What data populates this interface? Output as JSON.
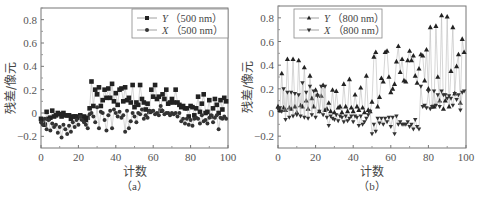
{
  "figure": {
    "panels": [
      {
        "id": "a",
        "sub_label": "（a）",
        "ylabel": "残差/像元",
        "xlabel": "计数",
        "legend": [
          {
            "series": "Y",
            "label_var": "Y",
            "label_rest": "（500 nm）",
            "marker": "square"
          },
          {
            "series": "X",
            "label_var": "X",
            "label_rest": "（500 nm）",
            "marker": "circle"
          }
        ]
      },
      {
        "id": "b",
        "sub_label": "（b）",
        "ylabel": "残差/像元",
        "xlabel": "计数",
        "legend": [
          {
            "series": "Y",
            "label_var": "Y",
            "label_rest": "（800 nm）",
            "marker": "triangle-up"
          },
          {
            "series": "X",
            "label_var": "X",
            "label_rest": "（800 nm）",
            "marker": "triangle-down"
          }
        ]
      }
    ]
  },
  "chart_data": [
    {
      "type": "scatter",
      "title": "(a)",
      "xlabel": "计数",
      "ylabel": "残差/像元",
      "xlim": [
        0,
        100
      ],
      "ylim": [
        -0.3,
        0.9
      ],
      "xticks": [
        0,
        20,
        40,
        60,
        80,
        100
      ],
      "yticks": [
        -0.2,
        0,
        0.2,
        0.4,
        0.6,
        0.8
      ],
      "ytick_labels": [
        "-0.2",
        "0",
        "0.2",
        "0.4",
        "0.6",
        "0.8"
      ],
      "grid": false,
      "legend_position": "upper right",
      "series": [
        {
          "name": "Y（500 nm）",
          "marker": "square",
          "x": [
            0,
            1,
            2,
            3,
            4,
            5,
            6,
            7,
            8,
            9,
            10,
            11,
            12,
            13,
            14,
            15,
            16,
            17,
            18,
            19,
            20,
            21,
            22,
            23,
            24,
            25,
            26,
            27,
            28,
            29,
            30,
            31,
            32,
            33,
            34,
            35,
            36,
            37,
            38,
            39,
            40,
            41,
            42,
            43,
            44,
            45,
            46,
            47,
            48,
            49,
            50,
            51,
            52,
            53,
            54,
            55,
            56,
            57,
            58,
            59,
            60,
            61,
            62,
            63,
            64,
            65,
            66,
            67,
            68,
            69,
            70,
            71,
            72,
            73,
            74,
            75,
            76,
            77,
            78,
            79,
            80,
            81,
            82,
            83,
            84,
            85,
            86,
            87,
            88,
            89,
            90,
            91,
            92,
            93,
            94,
            95,
            96,
            97,
            98,
            99
          ],
          "values": [
            -0.05,
            -0.08,
            -0.1,
            0.01,
            -0.05,
            -0.04,
            0.02,
            -0.03,
            -0.02,
            0.0,
            -0.01,
            -0.03,
            0.0,
            -0.02,
            -0.02,
            -0.02,
            -0.05,
            -0.03,
            -0.03,
            -0.03,
            -0.04,
            -0.02,
            -0.05,
            -0.03,
            -0.06,
            -0.04,
            0.04,
            0.27,
            0.06,
            0.2,
            0.16,
            0.22,
            0.06,
            0.11,
            0.2,
            0.13,
            0.21,
            0.13,
            0.25,
            0.1,
            0.17,
            0.07,
            0.2,
            0.21,
            0.1,
            0.22,
            0.11,
            0.13,
            0.09,
            0.24,
            0.05,
            0.09,
            0.07,
            0.24,
            0.12,
            0.09,
            0.03,
            0.08,
            0.01,
            0.2,
            0.14,
            0.24,
            0.12,
            0.14,
            0.02,
            0.16,
            0.12,
            0.2,
            0.08,
            0.09,
            0.12,
            0.09,
            0.2,
            0.09,
            0.07,
            0.05,
            0.06,
            0.04,
            0.04,
            -0.03,
            0.06,
            0.05,
            -0.02,
            0.04,
            0.14,
            0.01,
            0.08,
            0.16,
            0.0,
            0.01,
            0.11,
            -0.03,
            0.04,
            0.12,
            0.07,
            0.0,
            0.11,
            0.03,
            0.13,
            0.1
          ]
        },
        {
          "name": "X（500 nm）",
          "marker": "circle",
          "x": [
            0,
            1,
            2,
            3,
            4,
            5,
            6,
            7,
            8,
            9,
            10,
            11,
            12,
            13,
            14,
            15,
            16,
            17,
            18,
            19,
            20,
            21,
            22,
            23,
            24,
            25,
            26,
            27,
            28,
            29,
            30,
            31,
            32,
            33,
            34,
            35,
            36,
            37,
            38,
            39,
            40,
            41,
            42,
            43,
            44,
            45,
            46,
            47,
            48,
            49,
            50,
            51,
            52,
            53,
            54,
            55,
            56,
            57,
            58,
            59,
            60,
            61,
            62,
            63,
            64,
            65,
            66,
            67,
            68,
            69,
            70,
            71,
            72,
            73,
            74,
            75,
            76,
            77,
            78,
            79,
            80,
            81,
            82,
            83,
            84,
            85,
            86,
            87,
            88,
            89,
            90,
            91,
            92,
            93,
            94,
            95,
            96,
            97,
            98,
            99
          ],
          "values": [
            -0.08,
            -0.1,
            -0.05,
            -0.14,
            -0.06,
            -0.15,
            -0.09,
            -0.12,
            -0.1,
            -0.17,
            -0.12,
            -0.21,
            -0.1,
            -0.14,
            -0.18,
            -0.11,
            -0.16,
            -0.08,
            -0.12,
            -0.06,
            -0.1,
            -0.03,
            -0.06,
            -0.08,
            -0.1,
            -0.13,
            -0.01,
            0.0,
            -0.03,
            -0.08,
            0.05,
            -0.13,
            0.01,
            0.0,
            -0.06,
            -0.15,
            -0.02,
            0.02,
            -0.13,
            0.03,
            0.0,
            -0.03,
            0.01,
            -0.04,
            -0.02,
            -0.16,
            0.02,
            -0.13,
            -0.07,
            0.0,
            -0.03,
            -0.08,
            0.0,
            -0.01,
            0.03,
            -0.05,
            -0.02,
            -0.04,
            0.02,
            0.01,
            0.02,
            -0.01,
            0.0,
            -0.02,
            0.06,
            0.02,
            -0.01,
            0.0,
            0.0,
            -0.02,
            0.0,
            -0.01,
            0.0,
            -0.03,
            0.0,
            -0.07,
            -0.05,
            -0.09,
            -0.05,
            -0.1,
            -0.06,
            -0.11,
            -0.05,
            -0.04,
            -0.05,
            -0.09,
            -0.02,
            -0.07,
            -0.06,
            -0.09,
            -0.04,
            -0.02,
            -0.08,
            -0.04,
            -0.02,
            -0.14,
            -0.04,
            -0.05,
            -0.03,
            -0.05
          ]
        }
      ]
    },
    {
      "type": "scatter",
      "title": "(b)",
      "xlabel": "计数",
      "ylabel": "残差/像元",
      "xlim": [
        0,
        100
      ],
      "ylim": [
        -0.3,
        0.9
      ],
      "xticks": [
        0,
        20,
        40,
        60,
        80,
        100
      ],
      "yticks": [
        -0.2,
        0,
        0.2,
        0.4,
        0.6,
        0.8
      ],
      "ytick_labels": [
        "-0.2",
        "0",
        "0.2",
        "0.4",
        "0.6",
        "0.8"
      ],
      "grid": false,
      "legend_position": "upper left",
      "series": [
        {
          "name": "Y（800 nm）",
          "marker": "triangle-up",
          "x": [
            0,
            1,
            2,
            3,
            4,
            5,
            6,
            7,
            8,
            9,
            10,
            11,
            12,
            13,
            14,
            15,
            16,
            17,
            18,
            19,
            20,
            21,
            22,
            23,
            24,
            25,
            26,
            27,
            28,
            29,
            30,
            31,
            32,
            33,
            34,
            35,
            36,
            37,
            38,
            39,
            40,
            41,
            42,
            43,
            44,
            45,
            46,
            47,
            48,
            49,
            50,
            51,
            52,
            53,
            54,
            55,
            56,
            57,
            58,
            59,
            60,
            61,
            62,
            63,
            64,
            65,
            66,
            67,
            68,
            69,
            70,
            71,
            72,
            73,
            74,
            75,
            76,
            77,
            78,
            79,
            80,
            81,
            82,
            83,
            84,
            85,
            86,
            87,
            88,
            89,
            90,
            91,
            92,
            93,
            94,
            95,
            96,
            97,
            98,
            99
          ],
          "values": [
            0.05,
            0.02,
            0.33,
            0.04,
            0.02,
            0.45,
            0.04,
            0.03,
            0.45,
            0.05,
            0.0,
            0.44,
            0.06,
            0.05,
            0.38,
            0.1,
            0.03,
            0.31,
            0.12,
            0.05,
            0.19,
            0.15,
            0.01,
            0.14,
            0.23,
            0.02,
            0.03,
            0.08,
            0.01,
            0.19,
            0.0,
            0.18,
            0.04,
            0.05,
            0.0,
            0.24,
            0.05,
            0.01,
            0.28,
            0.04,
            0.01,
            0.15,
            0.05,
            0.02,
            0.21,
            0.04,
            0.0,
            0.31,
            0.02,
            0.01,
            0.09,
            0.47,
            0.51,
            0.05,
            0.13,
            0.29,
            0.26,
            0.51,
            0.52,
            0.3,
            0.17,
            0.2,
            0.24,
            0.43,
            0.56,
            0.34,
            0.45,
            0.27,
            0.26,
            0.44,
            0.52,
            0.44,
            0.48,
            0.31,
            0.25,
            0.37,
            0.49,
            0.48,
            0.27,
            0.53,
            0.2,
            0.72,
            0.05,
            0.05,
            0.73,
            0.3,
            0.1,
            0.82,
            0.03,
            0.1,
            0.81,
            0.05,
            0.35,
            0.72,
            0.16,
            0.39,
            0.49,
            0.08,
            0.62,
            0.51
          ]
        },
        {
          "name": "X（800 nm）",
          "marker": "triangle-down",
          "x": [
            0,
            1,
            2,
            3,
            4,
            5,
            6,
            7,
            8,
            9,
            10,
            11,
            12,
            13,
            14,
            15,
            16,
            17,
            18,
            19,
            20,
            21,
            22,
            23,
            24,
            25,
            26,
            27,
            28,
            29,
            30,
            31,
            32,
            33,
            34,
            35,
            36,
            37,
            38,
            39,
            40,
            41,
            42,
            43,
            44,
            45,
            46,
            47,
            48,
            49,
            50,
            51,
            52,
            53,
            54,
            55,
            56,
            57,
            58,
            59,
            60,
            61,
            62,
            63,
            64,
            65,
            66,
            67,
            68,
            69,
            70,
            71,
            72,
            73,
            74,
            75,
            76,
            77,
            78,
            79,
            80,
            81,
            82,
            83,
            84,
            85,
            86,
            87,
            88,
            89,
            90,
            91,
            92,
            93,
            94,
            95,
            96,
            97,
            98,
            99
          ],
          "values": [
            0.03,
            0.04,
            0.01,
            0.2,
            -0.06,
            0.17,
            -0.04,
            0.17,
            -0.03,
            0.16,
            -0.02,
            0.15,
            -0.03,
            0.25,
            -0.04,
            0.17,
            -0.05,
            0.22,
            -0.02,
            0.18,
            -0.04,
            0.14,
            0.01,
            0.22,
            -0.02,
            0.22,
            -0.04,
            -0.11,
            -0.03,
            -0.05,
            -0.06,
            -0.02,
            -0.07,
            -0.03,
            -0.04,
            -0.08,
            -0.03,
            -0.07,
            -0.05,
            -0.03,
            -0.08,
            -0.03,
            -0.04,
            -0.11,
            -0.03,
            -0.1,
            -0.08,
            -0.05,
            -0.02,
            0.01,
            -0.18,
            -0.1,
            -0.16,
            -0.05,
            -0.09,
            -0.05,
            -0.1,
            -0.05,
            -0.08,
            -0.04,
            -0.12,
            -0.04,
            -0.18,
            -0.03,
            -0.1,
            -0.08,
            -0.1,
            -0.1,
            -0.1,
            -0.08,
            -0.12,
            -0.1,
            -0.14,
            -0.06,
            -0.12,
            -0.14,
            0.22,
            0.05,
            0.06,
            0.04,
            0.18,
            0.03,
            0.05,
            0.18,
            0.06,
            0.15,
            0.05,
            0.18,
            0.15,
            0.15,
            0.12,
            0.14,
            0.12,
            0.06,
            0.16,
            0.11,
            0.15,
            0.02,
            0.17,
            0.18
          ]
        }
      ]
    }
  ]
}
